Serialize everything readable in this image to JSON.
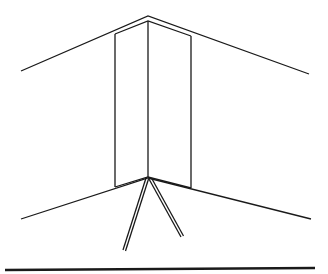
{
  "diagram": {
    "title": "",
    "colors": {
      "background": "#ffffff",
      "stroke": "#1a1a1a"
    },
    "lines": {
      "ceiling_outer": [
        [
          21,
          71
        ],
        [
          148,
          16
        ],
        [
          309,
          74
        ]
      ],
      "ceiling_inner": [
        [
          115,
          34
        ],
        [
          148,
          21
        ],
        [
          191,
          36
        ]
      ],
      "floor_outer": [
        [
          21,
          219
        ],
        [
          148,
          178
        ],
        [
          311,
          219
        ]
      ],
      "floor_inner": [
        [
          115,
          187
        ],
        [
          148,
          177
        ],
        [
          191,
          188
        ]
      ],
      "panel_left_edge": [
        [
          115,
          34
        ],
        [
          115,
          187
        ]
      ],
      "panel_center_edge": [
        [
          148,
          21
        ],
        [
          148,
          177
        ]
      ],
      "panel_right_edge": [
        [
          191,
          36
        ],
        [
          191,
          188
        ]
      ],
      "leg_left": [
        [
          147,
          178
        ],
        [
          124,
          251
        ]
      ],
      "leg_right": [
        [
          150,
          178
        ],
        [
          183,
          237
        ]
      ],
      "ground_line": [
        [
          5,
          270
        ],
        [
          315,
          268
        ]
      ]
    }
  }
}
